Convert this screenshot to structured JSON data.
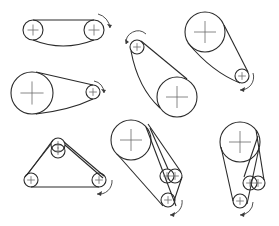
{
  "colors": {
    "line": "#2a2a2a",
    "center_mark": "#6a6a6a",
    "background": "#ffffff"
  },
  "diagrams": [
    {
      "id": "two-pulley-equal",
      "pulleys": [
        {
          "cx": 33,
          "cy": 30,
          "r": 10
        },
        {
          "cx": 94,
          "cy": 30,
          "r": 10
        }
      ],
      "belts": [
        "M33 20 L94 20",
        "M33 40 Q63 52 94 40"
      ],
      "arrow": {
        "path": "M98 14 A16 16 0 0 1 110 28",
        "head": "110,28 107,24 112,25"
      }
    },
    {
      "id": "large-small-horizontal",
      "pulleys": [
        {
          "cx": 32,
          "cy": 93,
          "r": 21
        },
        {
          "cx": 93,
          "cy": 92,
          "r": 7
        }
      ],
      "belts": [
        "M36 72 L93 85",
        "M36 114 Q70 110 93 99"
      ],
      "arrow": {
        "path": "M94 81 A12 12 0 0 1 104 93",
        "head": "104,93 101,89 106,90"
      }
    },
    {
      "id": "small-top-large-bottom",
      "pulleys": [
        {
          "cx": 137,
          "cy": 47,
          "r": 7
        },
        {
          "cx": 177,
          "cy": 97,
          "r": 20
        }
      ],
      "belts": [
        "M141 41 L187 79",
        "M131 51 Q138 88 160 108"
      ],
      "arrow": {
        "path": "M146 34 A12 12 0 0 0 126 44",
        "head": "126,44 125,39 129,42"
      }
    },
    {
      "id": "large-top-small-bottom",
      "pulleys": [
        {
          "cx": 205,
          "cy": 32,
          "r": 20
        },
        {
          "cx": 242,
          "cy": 76,
          "r": 7
        }
      ],
      "belts": [
        "M224 25 L248 72",
        "M188 43 Q212 72 240 83"
      ],
      "arrow": {
        "path": "M253 73 A13 13 0 0 1 240 90",
        "head": "240,90 245,87 244,92"
      }
    },
    {
      "id": "triangle-with-tensioner",
      "pulleys": [
        {
          "cx": 58,
          "cy": 145,
          "r": 7
        },
        {
          "cx": 58,
          "cy": 151,
          "r": 7
        },
        {
          "cx": 31,
          "cy": 180,
          "r": 7
        },
        {
          "cx": 99,
          "cy": 180,
          "r": 7
        }
      ],
      "belts": [
        "M51 144 L25 177",
        "M53 140 L27 175",
        "M64 142 L104 176",
        "M65 145 L103 178",
        "M31 187 L99 187"
      ],
      "arrow": {
        "path": "M112 180 A13 13 0 0 1 97 194",
        "head": "97,194 102,191 101,196"
      }
    },
    {
      "id": "large-with-double-idler",
      "pulleys": [
        {
          "cx": 131,
          "cy": 140,
          "r": 20
        },
        {
          "cx": 167,
          "cy": 176,
          "r": 7
        },
        {
          "cx": 175,
          "cy": 176,
          "r": 7
        },
        {
          "cx": 168,
          "cy": 200,
          "r": 7
        }
      ],
      "belts": [
        "M117 154 L163 206",
        "M146 127 L176 206",
        "M148 124 L181 172",
        "M150 128 L168 169",
        "M182 177 L174 201"
      ],
      "arrow": {
        "path": "M182 200 A13 13 0 0 1 170 215",
        "head": "170,215 175,212 174,217"
      }
    },
    {
      "id": "vertical-with-double-idler",
      "pulleys": [
        {
          "cx": 240,
          "cy": 142,
          "r": 20
        },
        {
          "cx": 250,
          "cy": 183,
          "r": 7
        },
        {
          "cx": 258,
          "cy": 183,
          "r": 7
        },
        {
          "cx": 240,
          "cy": 201,
          "r": 7
        }
      ],
      "belts": [
        "M221 147 L233 201",
        "M259 148 L247 204",
        "M256 130 L264 180",
        "M258 136 L244 177"
      ],
      "arrow": {
        "path": "M253 202 A13 13 0 0 1 240 215",
        "head": "240,215 245,212 244,217"
      }
    }
  ]
}
